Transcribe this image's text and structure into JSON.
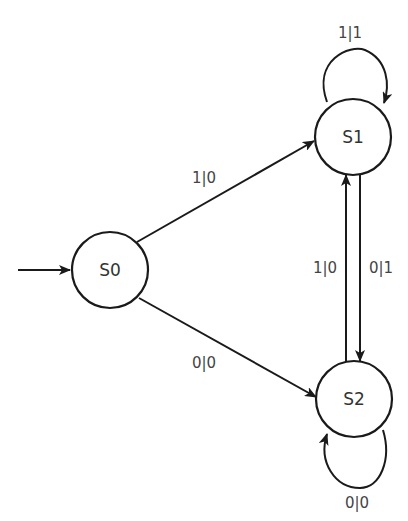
{
  "diagram": {
    "type": "finite-state-machine (Mealy)",
    "colors": {
      "stroke": "#1a1a1a",
      "text": "#333333",
      "background": "#ffffff"
    },
    "states": [
      {
        "id": "S0",
        "label": "S0",
        "initial": true
      },
      {
        "id": "S1",
        "label": "S1"
      },
      {
        "id": "S2",
        "label": "S2"
      }
    ],
    "transitions": [
      {
        "from": "S0",
        "to": "S1",
        "label": "1|0"
      },
      {
        "from": "S0",
        "to": "S2",
        "label": "0|0"
      },
      {
        "from": "S1",
        "to": "S1",
        "label": "1|1"
      },
      {
        "from": "S1",
        "to": "S2",
        "label": "0|1"
      },
      {
        "from": "S2",
        "to": "S1",
        "label": "1|0"
      },
      {
        "from": "S2",
        "to": "S2",
        "label": "0|0"
      }
    ]
  }
}
